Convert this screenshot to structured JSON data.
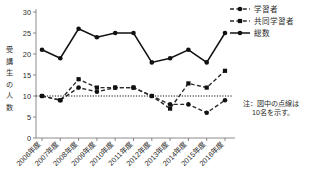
{
  "chart_data": {
    "type": "line",
    "title": "",
    "subtitle": "",
    "xlabel": "",
    "ylabel": "受講生の人数",
    "ylim": [
      0,
      30
    ],
    "yticks": [
      0,
      5,
      10,
      15,
      20,
      25,
      30
    ],
    "ytick_labels": [
      "0",
      "5",
      "10",
      "15",
      "20",
      "25",
      "30"
    ],
    "grid": false,
    "legend_position": "top-right",
    "categories": [
      "2006年度",
      "2007年度",
      "2008年度",
      "2009年度",
      "2010年度",
      "2011年度",
      "2012年度",
      "2013年度",
      "2014年度",
      "2015年度",
      "2016年度"
    ],
    "series": [
      {
        "name": "学習者",
        "style": "dashed",
        "marker": "circle",
        "values": [
          10,
          9,
          12,
          11,
          12,
          12,
          10,
          8,
          8,
          6,
          9
        ]
      },
      {
        "name": "共同学習者",
        "style": "dashed",
        "marker": "square",
        "values": [
          10,
          9,
          14,
          12,
          12,
          12,
          10,
          7,
          13,
          12,
          16
        ]
      },
      {
        "name": "総数",
        "style": "solid",
        "marker": "circle",
        "values": [
          21,
          19,
          26,
          24,
          25,
          25,
          18,
          19,
          21,
          18,
          25
        ]
      }
    ],
    "reference_line": {
      "value": 10,
      "style": "dotted",
      "label": "10名"
    },
    "annotations": [
      {
        "name": "figure-note",
        "line1": "注：図中の点線は",
        "line2": "10名を示す。"
      }
    ]
  },
  "legend": {
    "items": [
      {
        "label": "学習者",
        "marker": "circle",
        "style": "dashed"
      },
      {
        "label": "共同学習者",
        "marker": "square",
        "style": "dashed"
      },
      {
        "label": "総数",
        "marker": "circle",
        "style": "solid"
      }
    ]
  },
  "ylabel_chars": [
    "受",
    "講",
    "生",
    "の",
    "人",
    "数"
  ]
}
